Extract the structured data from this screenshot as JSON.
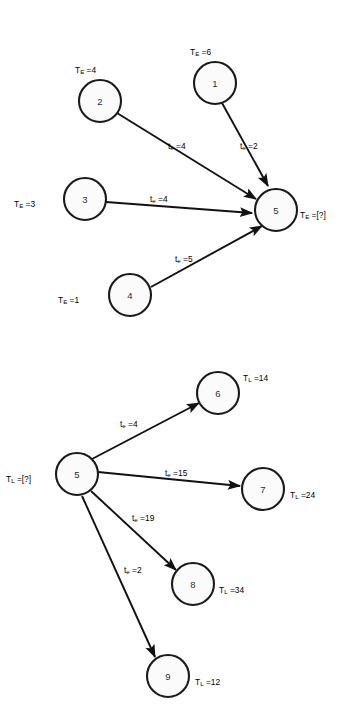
{
  "diagram": {
    "type": "directed-graph",
    "background_color": "#ffffff",
    "node_fill_color": "#fbfbfb",
    "node_stroke_color": "#1a1a1a",
    "edge_color": "#111111",
    "panels": [
      {
        "id": "panel-earliest-times",
        "name": "earliest-event-time-merge",
        "tag_symbol": "T",
        "tag_subscript": "E",
        "nodes": [
          {
            "id": "2",
            "label": "2",
            "cx": 100,
            "cy": 101,
            "r": 21,
            "tag_prefix": "T",
            "tag_sub": "E",
            "tag_value": "4",
            "tag_text": "T_E =4",
            "tag_pos": "above",
            "tag_x": 75,
            "tag_y": 59
          },
          {
            "id": "1",
            "label": "1",
            "cx": 215,
            "cy": 83,
            "r": 21,
            "tag_prefix": "T",
            "tag_sub": "E",
            "tag_value": "6",
            "tag_text": "T_E =6",
            "tag_pos": "above",
            "tag_x": 190,
            "tag_y": 41
          },
          {
            "id": "3",
            "label": "3",
            "cx": 85,
            "cy": 199,
            "r": 21,
            "tag_prefix": "T",
            "tag_sub": "E",
            "tag_value": "3",
            "tag_text": "T_E =3",
            "tag_pos": "left",
            "tag_x": 14,
            "tag_y": 193
          },
          {
            "id": "4",
            "label": "4",
            "cx": 130,
            "cy": 295,
            "r": 21,
            "tag_prefix": "T",
            "tag_sub": "E",
            "tag_value": "1",
            "tag_text": "T_E =1",
            "tag_pos": "left",
            "tag_x": 58,
            "tag_y": 289
          },
          {
            "id": "5",
            "label": "5",
            "cx": 276,
            "cy": 210,
            "r": 21,
            "tag_prefix": "T",
            "tag_sub": "E",
            "tag_value": "[?]",
            "tag_text": "T_E =[?]",
            "tag_pos": "right",
            "tag_x": 300,
            "tag_y": 204
          }
        ],
        "edges": [
          {
            "from": "2",
            "to": "5",
            "label_prefix": "t",
            "label_sub": "e",
            "value": "4",
            "label_text": "t_e =4",
            "label_x": 168,
            "label_y": 135
          },
          {
            "from": "1",
            "to": "5",
            "label_prefix": "t",
            "label_sub": "e",
            "value": "2",
            "label_text": "t_e =2",
            "label_x": 240,
            "label_y": 135
          },
          {
            "from": "3",
            "to": "5",
            "label_prefix": "t",
            "label_sub": "e",
            "value": "4",
            "label_text": "t_e =4",
            "label_x": 150,
            "label_y": 188
          },
          {
            "from": "4",
            "to": "5",
            "label_prefix": "t",
            "label_sub": "e",
            "value": "5",
            "label_text": "t_e =5",
            "label_x": 175,
            "label_y": 248
          }
        ]
      },
      {
        "id": "panel-latest-times",
        "name": "latest-event-time-split",
        "tag_symbol": "T",
        "tag_subscript": "L",
        "nodes": [
          {
            "id": "5b",
            "label": "5",
            "cx": 77,
            "cy": 474,
            "r": 21,
            "tag_prefix": "T",
            "tag_sub": "L",
            "tag_value": "[?]",
            "tag_text": "T_L =[?]",
            "tag_pos": "left",
            "tag_x": 6,
            "tag_y": 468
          },
          {
            "id": "6",
            "label": "6",
            "cx": 218,
            "cy": 393,
            "r": 21,
            "tag_prefix": "T",
            "tag_sub": "L",
            "tag_value": "14",
            "tag_text": "T_L =14",
            "tag_pos": "right",
            "tag_x": 243,
            "tag_y": 367
          },
          {
            "id": "7",
            "label": "7",
            "cx": 263,
            "cy": 489,
            "r": 21,
            "tag_prefix": "T",
            "tag_sub": "L",
            "tag_value": "24",
            "tag_text": "T_L =24",
            "tag_pos": "right",
            "tag_x": 290,
            "tag_y": 484
          },
          {
            "id": "8",
            "label": "8",
            "cx": 193,
            "cy": 584,
            "r": 21,
            "tag_prefix": "T",
            "tag_sub": "L",
            "tag_value": "34",
            "tag_text": "T_L =34",
            "tag_pos": "right",
            "tag_x": 219,
            "tag_y": 579
          },
          {
            "id": "9",
            "label": "9",
            "cx": 168,
            "cy": 676,
            "r": 21,
            "tag_prefix": "T",
            "tag_sub": "L",
            "tag_value": "12",
            "tag_text": "T_L =12",
            "tag_pos": "right",
            "tag_x": 195,
            "tag_y": 671
          }
        ],
        "edges": [
          {
            "from": "5b",
            "to": "6",
            "label_prefix": "t",
            "label_sub": "e",
            "value": "4",
            "label_text": "t_e =4",
            "label_x": 120,
            "label_y": 413
          },
          {
            "from": "5b",
            "to": "7",
            "label_prefix": "t",
            "label_sub": "e",
            "value": "15",
            "label_text": "t_e =15",
            "label_x": 165,
            "label_y": 462
          },
          {
            "from": "5b",
            "to": "8",
            "label_prefix": "t",
            "label_sub": "e",
            "value": "19",
            "label_text": "t_e =19",
            "label_x": 132,
            "label_y": 507
          },
          {
            "from": "5b",
            "to": "9",
            "label_prefix": "t",
            "label_sub": "e",
            "value": "2",
            "label_text": "t_e =2",
            "label_x": 124,
            "label_y": 559
          }
        ]
      }
    ]
  }
}
